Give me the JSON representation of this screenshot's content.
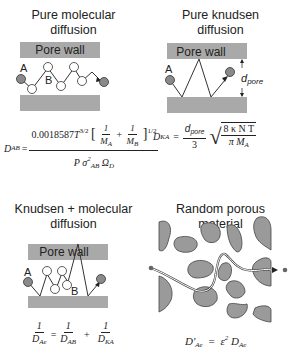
{
  "colors": {
    "wall": "#a9a9a9",
    "particle": "#8a8a8a",
    "line": "#333333"
  },
  "panels": [
    {
      "title_line1": "Pure molecular",
      "title_line2": "diffusion",
      "wall_label": "Pore wall",
      "label_a": "A",
      "label_b": "B",
      "equation": {
        "lhs": "D",
        "lhs_sub": "AB",
        "eq": "=",
        "num_coef": "0.0018587",
        "num_T": "T",
        "num_T_exp": "3/2",
        "num_frac1_num": "1",
        "num_frac1_den": "M",
        "num_frac1_den_sub": "A",
        "plus": "+",
        "num_frac2_num": "1",
        "num_frac2_den": "M",
        "num_frac2_den_sub": "B",
        "bracket_exp": "1/2",
        "den_P": "P",
        "den_sigma": "σ",
        "den_sigma_sup": "2",
        "den_sigma_sub": "AB",
        "den_omega": "Ω",
        "den_omega_sub": "D"
      }
    },
    {
      "title_line1": "Pure knudsen",
      "title_line2": "diffusion",
      "wall_label": "Pore wall",
      "label_a": "A",
      "dim_label": "d",
      "dim_label_sub": "pore",
      "equation": {
        "lhs": "D",
        "lhs_sub": "KA",
        "eq": "=",
        "frac_num": "d",
        "frac_num_sub": "pore",
        "frac_den": "3",
        "sqrt_num": "8 κ N T",
        "sqrt_den": "π M",
        "sqrt_den_sub": "A"
      }
    },
    {
      "title_line1": "Knudsen + molecular",
      "title_line2": "diffusion",
      "wall_label": "Pore wall",
      "label_a": "A",
      "label_b": "B",
      "equation": {
        "t1_num": "1",
        "t1_den": "D",
        "t1_den_sub": "Ae",
        "eq": "=",
        "t2_num": "1",
        "t2_den": "D",
        "t2_den_sub": "AB",
        "plus": "+",
        "t3_num": "1",
        "t3_den": "D",
        "t3_den_sub": "KA"
      }
    },
    {
      "title_line1": "Random porous",
      "title_line2": "material",
      "equation": {
        "lhs": "D'",
        "lhs_sub": "Ae",
        "eq": "=",
        "eps": "ε",
        "eps_sup": "2",
        "rhs": "D",
        "rhs_sub": "Ae"
      }
    }
  ]
}
